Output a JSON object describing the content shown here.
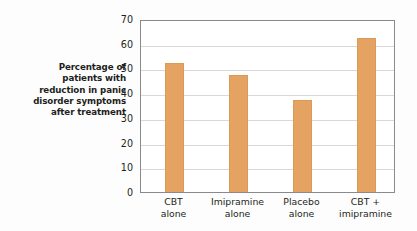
{
  "chart_data": {
    "type": "bar",
    "title": "",
    "xlabel": "",
    "ylabel": "Percentage of patients with reduction in panic disorder symptoms after treatment",
    "ylabel_lines": [
      "Percentage of",
      "patients with",
      "reduction in panic",
      "disorder symptoms",
      "after treatment"
    ],
    "categories": [
      "CBT alone",
      "Imipramine alone",
      "Placebo alone",
      "CBT + imipramine"
    ],
    "category_lines": [
      [
        "CBT",
        "alone"
      ],
      [
        "Imipramine",
        "alone"
      ],
      [
        "Placebo",
        "alone"
      ],
      [
        "CBT +",
        "imipramine"
      ]
    ],
    "values": [
      53,
      48,
      37.5,
      63
    ],
    "ylim": [
      0,
      70
    ],
    "yticks": [
      0,
      10,
      20,
      30,
      40,
      50,
      60,
      70
    ],
    "ytick_labels": [
      "0",
      "10",
      "20",
      "30",
      "40",
      "50",
      "60",
      "70"
    ],
    "grid": true,
    "legend": null,
    "colors": {
      "bar_fill": "#e4a263",
      "bar_edge": "#dc9a55",
      "gridline": "#d8d8d8",
      "frame": "#8a8a8a",
      "text": "#231f20",
      "background": "#fdfdfd"
    }
  }
}
